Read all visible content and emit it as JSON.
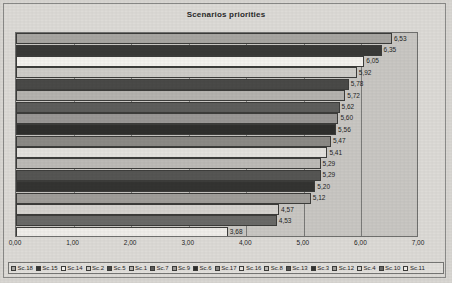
{
  "chart_data": {
    "type": "bar",
    "orientation": "horizontal",
    "title": "Scenarios priorities",
    "xlabel": "",
    "ylabel": "",
    "xlim": [
      0,
      7
    ],
    "xticks": [
      "0,00",
      "1,00",
      "2,00",
      "3,00",
      "4,00",
      "5,00",
      "6,00",
      "7,00"
    ],
    "xtick_values": [
      0,
      1,
      2,
      3,
      4,
      5,
      6,
      7
    ],
    "grid": true,
    "legend_position": "bottom",
    "categories": [
      "Sc.18",
      "Sc.15",
      "Sc.14",
      "Sc.2",
      "Sc.5",
      "Sc.1",
      "Sc.7",
      "Sc.9",
      "Sc.6",
      "Sc.17",
      "Sc.16",
      "Sc.8",
      "Sc.13",
      "Sc.3",
      "Sc.12",
      "Sc.4",
      "Sc.10",
      "Sc.11"
    ],
    "values": [
      6.53,
      6.35,
      6.05,
      5.92,
      5.78,
      5.72,
      5.62,
      5.6,
      5.56,
      5.47,
      5.41,
      5.29,
      5.29,
      5.2,
      5.12,
      4.57,
      4.53,
      3.68
    ],
    "data_labels": [
      "6,53",
      "6,35",
      "6,05",
      "5,92",
      "5,78",
      "5,72",
      "5,62",
      "5,60",
      "5,56",
      "5,47",
      "5,41",
      "5,29",
      "5,29",
      "5,20",
      "5,12",
      "4,57",
      "4,53",
      "3,68"
    ],
    "colors": [
      "#a8a6a2",
      "#3a3a38",
      "#f4f2ee",
      "#cfcdc9",
      "#4a4a48",
      "#b5b3af",
      "#5e5e5c",
      "#9a9896",
      "#2f2f2d",
      "#8c8a86",
      "#e4e2de",
      "#bdbbb7",
      "#565654",
      "#343432",
      "#a09e9a",
      "#d6d4d0",
      "#6a6a68",
      "#f0eeea"
    ],
    "plot_background": "#c9c7c3",
    "chart_background": "#dddbd7"
  }
}
